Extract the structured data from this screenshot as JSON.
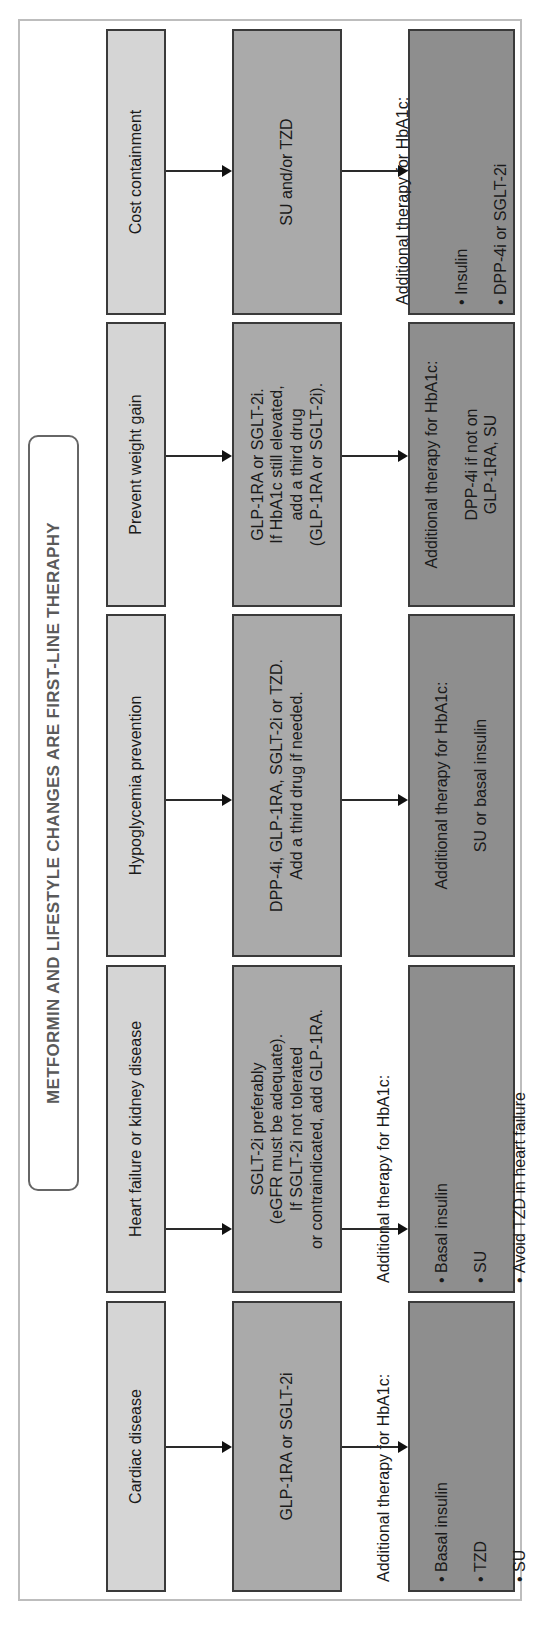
{
  "title": "METFORMIN AND LIFESTYLE CHANGES ARE FIRST-LINE THERAPHY",
  "colors": {
    "condition_box": "#d5d5d5",
    "first_add_box": "#aaaaaa",
    "additional_box": "#8e8e8e",
    "frame_border": "#bdbdbd"
  },
  "columns": [
    {
      "condition": "Cardiac disease",
      "therapy": "GLP-1RA or SGLT-2i",
      "additional": {
        "heading": "Additional therapy for HbA1c:",
        "items": [
          "Basal insulin",
          "TZD",
          "SU"
        ]
      }
    },
    {
      "condition": "Heart failure or kidney disease",
      "therapy": "SGLT-2i preferably\n(eGFR must be adequate).\nIf SGLT-2i not tolerated\nor contraindicated, add GLP-1RA.",
      "additional": {
        "heading": "Additional therapy for HbA1c:",
        "items": [
          "Basal insulin",
          "SU",
          "Avoid TZD in heart failure"
        ]
      }
    },
    {
      "condition": "Hypoglycemia prevention",
      "therapy": "DPP-4i, GLP-1RA, SGLT-2i or TZD.\nAdd a third drug if needed.",
      "additional": {
        "heading": "Additional therapy for HbA1c:",
        "text": "SU or basal insulin"
      }
    },
    {
      "condition": "Prevent weight gain",
      "therapy": "GLP-1RA or SGLT-2i.\nIf HbA1c still elevated,\nadd a third drug\n(GLP-1RA or SGLT-2i).",
      "additional": {
        "heading": "Additional therapy for HbA1c:",
        "text": "DPP-4i if not on\nGLP-1RA, SU"
      }
    },
    {
      "condition": "Cost containment",
      "therapy": "SU and/or TZD",
      "additional": {
        "heading": "Additional therapy for HbA1c:",
        "items": [
          "Insulin",
          "DPP-4i or SGLT-2i"
        ]
      }
    }
  ]
}
